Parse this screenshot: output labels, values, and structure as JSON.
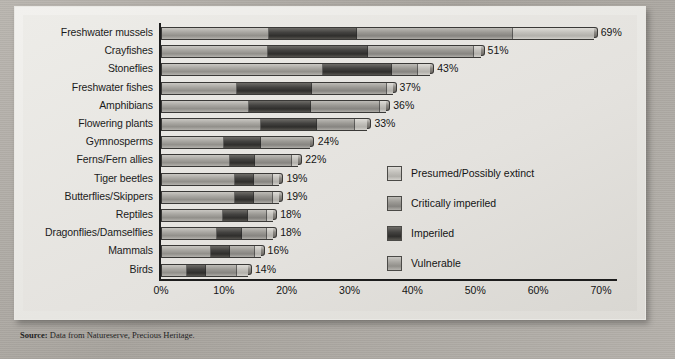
{
  "chart_data": {
    "type": "bar",
    "orientation": "horizontal",
    "stacked": true,
    "title": "",
    "xlabel": "",
    "ylabel": "",
    "xlim": [
      0,
      70
    ],
    "xticks": [
      "0%",
      "10%",
      "20%",
      "30%",
      "40%",
      "50%",
      "60%",
      "70%"
    ],
    "xtick_values": [
      0,
      10,
      20,
      30,
      40,
      50,
      60,
      70
    ],
    "grid": false,
    "legend_position": "middle-right",
    "categories": [
      "Freshwater mussels",
      "Crayfishes",
      "Stoneflies",
      "Freshwater fishes",
      "Amphibians",
      "Flowering plants",
      "Gymnosperms",
      "Ferns/Fern allies",
      "Tiger beetles",
      "Butterflies/Skippers",
      "Reptiles",
      "Dragonflies/Damselflies",
      "Mammals",
      "Birds"
    ],
    "totals": [
      69,
      51,
      43,
      37,
      36,
      33,
      24,
      22,
      19,
      19,
      18,
      18,
      16,
      14
    ],
    "total_labels": [
      "69%",
      "51%",
      "43%",
      "37%",
      "36%",
      "33%",
      "24%",
      "22%",
      "19%",
      "19%",
      "18%",
      "18%",
      "16%",
      "14%"
    ],
    "series": [
      {
        "name": "Vulnerable",
        "key": "vulnerable",
        "color": "#a9a7a2",
        "values": [
          17,
          17,
          26,
          12,
          14,
          16,
          10,
          11,
          12,
          12,
          10,
          9,
          8,
          4
        ]
      },
      {
        "name": "Imperiled",
        "key": "imperiled",
        "color": "#434240",
        "values": [
          14,
          16,
          11,
          12,
          10,
          9,
          6,
          4,
          3,
          3,
          4,
          4,
          3,
          3
        ]
      },
      {
        "name": "Critically imperiled",
        "key": "critically_imperiled",
        "color": "#9b9994",
        "values": [
          25,
          17,
          4,
          12,
          11,
          6,
          8,
          6,
          3,
          3,
          3,
          4,
          4,
          5
        ]
      },
      {
        "name": "Presumed/Possibly extinct",
        "key": "presumed_possibly_extinct",
        "color": "#c3c1bc",
        "values": [
          13,
          1,
          2,
          1,
          1,
          2,
          0,
          1,
          1,
          1,
          1,
          1,
          1,
          2
        ]
      }
    ]
  },
  "legend": {
    "items": [
      {
        "label": "Presumed/Possibly extinct",
        "key": "presumed_possibly_extinct"
      },
      {
        "label": "Critically imperiled",
        "key": "critically_imperiled"
      },
      {
        "label": "Imperiled",
        "key": "imperiled"
      },
      {
        "label": "Vulnerable",
        "key": "vulnerable"
      }
    ]
  },
  "source": {
    "label": "Source:",
    "text": " Data from Natureserve, Precious Heritage."
  }
}
